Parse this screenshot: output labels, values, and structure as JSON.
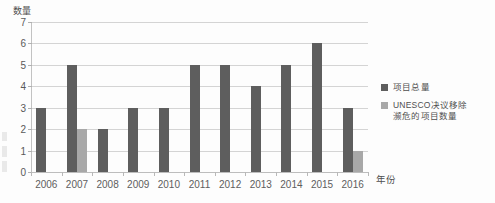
{
  "chart_data": {
    "type": "bar",
    "title": "",
    "subtitle": "",
    "xlabel": "年份",
    "ylabel": "数量",
    "categories": [
      "2006",
      "2007",
      "2008",
      "2009",
      "2010",
      "2011",
      "2012",
      "2013",
      "2014",
      "2015",
      "2016"
    ],
    "series": [
      {
        "name": "项目总量",
        "color": "#5e5e5e",
        "values": [
          3,
          5,
          2,
          3,
          3,
          5,
          5,
          4,
          5,
          6,
          3
        ]
      },
      {
        "name": "UNESCO决议移除濒危的项目数量",
        "color": "#a8a8a8",
        "values": [
          0,
          2,
          0,
          0,
          0,
          0,
          0,
          0,
          0,
          0,
          1
        ]
      }
    ],
    "ylim": [
      0,
      7
    ],
    "ytick_labels": [
      "0",
      "1",
      "2",
      "3",
      "4",
      "5",
      "6",
      "7"
    ],
    "grid": true,
    "legend_position": "right"
  },
  "legend": {
    "items": [
      {
        "label": "项目总量",
        "color": "#5e5e5e"
      },
      {
        "label": "UNESCO决议移除\n濒危的项目数量",
        "color": "#a8a8a8"
      }
    ]
  },
  "axes": {
    "y_title": "数量",
    "x_title": "年份"
  }
}
